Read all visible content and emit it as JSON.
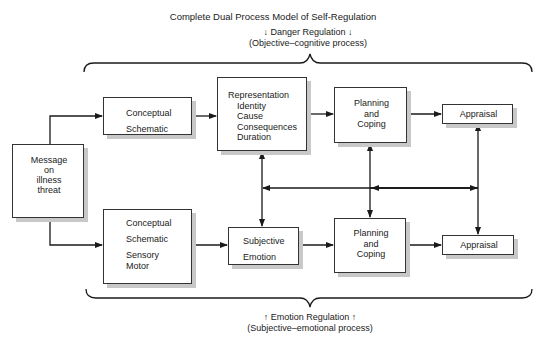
{
  "title": "Complete Dual Process Model of Self-Regulation",
  "top_label": {
    "line1": "↓ Danger Regulation ↓",
    "line2": "(Objective–cognitive process)"
  },
  "bottom_label": {
    "line1": "↑ Emotion Regulation ↑",
    "line2": "(Subjective–emotional process)"
  },
  "nodes": {
    "message": [
      "Message",
      "on",
      "illness",
      "threat"
    ],
    "top_conceptual": [
      "Conceptual",
      "Schematic"
    ],
    "representation": [
      "Representation",
      "Identity",
      "Cause",
      "Consequences",
      "Duration"
    ],
    "top_planning": [
      "Planning",
      "and",
      "Coping"
    ],
    "top_appraisal": "Appraisal",
    "bottom_conceptual": [
      "Conceptual",
      "Schematic",
      "Sensory",
      "Motor"
    ],
    "subjective": [
      "Subjective",
      "Emotion"
    ],
    "bottom_planning": [
      "Planning",
      "and",
      "Coping"
    ],
    "bottom_appraisal": "Appraisal"
  },
  "colors": {
    "line": "#1a1a1a",
    "shadow": "#c8c8c8"
  }
}
